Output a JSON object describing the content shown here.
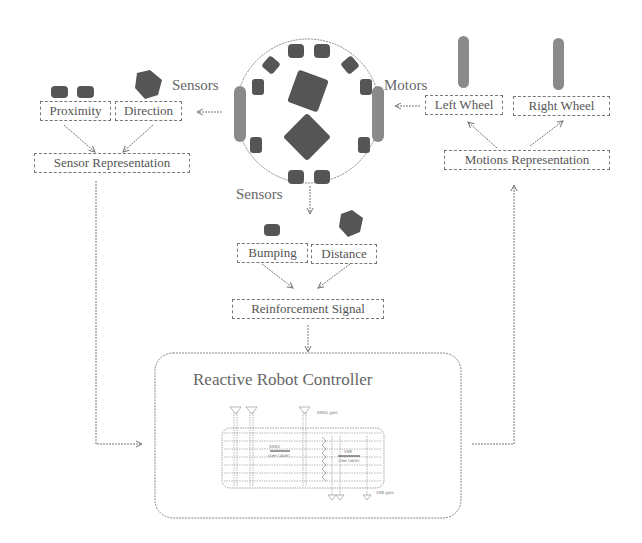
{
  "robot": {
    "sensors_left_label": "Sensors",
    "motors_label": "Motors",
    "sensors_bottom_label": "Sensors"
  },
  "sensor_branch": {
    "proximity": "Proximity",
    "direction": "Direction",
    "representation": "Sensor Representation"
  },
  "motor_branch": {
    "left_wheel": "Left Wheel",
    "right_wheel": "Right Wheel",
    "representation": "Motions Representation"
  },
  "reinforcement_branch": {
    "bumping": "Bumping",
    "distance": "Distance",
    "signal": "Reinforcement Signal"
  },
  "controller": {
    "title": "Reactive Robot Controller",
    "circuit_labels": {
      "top_right": "ASSO\ngain",
      "left_block": "ASSO",
      "left_block_sub": "(see table)",
      "right_block": "VSB",
      "right_block_sub": "(see table)",
      "bottom_right": "VSB\ngain"
    }
  },
  "colors": {
    "stroke": "#777777",
    "fill_dark": "#555555",
    "fill_wheel": "#8a8a8a",
    "text": "#555555"
  }
}
